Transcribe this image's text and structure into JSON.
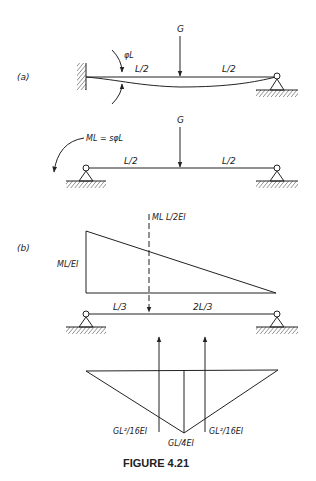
{
  "figure": {
    "caption": "FIGURE 4.21",
    "colors": {
      "ink": "#222222",
      "background": "#ffffff"
    }
  },
  "part_a": {
    "label": "(a)",
    "beam1": {
      "load_label": "G",
      "rotation_label": "φL",
      "span_left": "L/2",
      "span_right": "L/2",
      "left_support": "fixed",
      "right_support": "pin"
    },
    "beam2": {
      "load_label": "G",
      "moment_label": "ML = sφL",
      "span_left": "L/2",
      "span_right": "L/2",
      "left_support": "pin",
      "right_support": "pin"
    }
  },
  "part_b": {
    "label": "(b)",
    "moment_diagram": {
      "height_label": "ML/EI",
      "resultant_label": "ML L/2EI"
    },
    "conjugate_beam": {
      "span_left": "L/3",
      "span_right": "2L/3"
    },
    "deflection_diagram": {
      "left_label": "GL²/16EI",
      "center_label": "GL/4EI",
      "right_label": "GL²/16EI"
    }
  }
}
